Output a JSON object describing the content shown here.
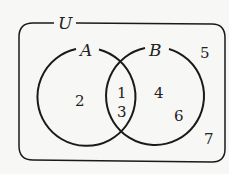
{
  "diagram": {
    "type": "venn",
    "universe_label": "U",
    "sets": [
      {
        "label": "A",
        "cx": 87,
        "cy": 96,
        "r": 49
      },
      {
        "label": "B",
        "cx": 155,
        "cy": 96,
        "r": 49
      }
    ],
    "regions": {
      "A_only": [
        "2"
      ],
      "A_and_B": [
        "1",
        "3"
      ],
      "B_only": [
        "4",
        "6"
      ],
      "outside": [
        "5",
        "7"
      ]
    },
    "elements": [
      {
        "value": "2",
        "x": 80,
        "y": 106
      },
      {
        "value": "1",
        "x": 121,
        "y": 94
      },
      {
        "value": "3",
        "x": 121,
        "y": 114
      },
      {
        "value": "4",
        "x": 158,
        "y": 96
      },
      {
        "value": "6",
        "x": 178,
        "y": 119
      },
      {
        "value": "5",
        "x": 205,
        "y": 58
      },
      {
        "value": "7",
        "x": 209,
        "y": 142
      }
    ],
    "colors": {
      "stroke": "#1a1a1a",
      "background": "#f7f7f5"
    }
  }
}
